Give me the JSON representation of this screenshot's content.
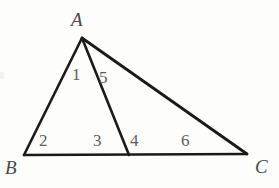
{
  "figure": {
    "type": "geometry-diagram",
    "background_color": "#fdfdfc",
    "stroke_color": "#1a1a1a",
    "label_color": "#4a4a4a",
    "angle_label_color": "#5d5d5d",
    "stroke_width": 2.6
  },
  "points": {
    "A": {
      "x": 82,
      "y": 38
    },
    "B": {
      "x": 24,
      "y": 155
    },
    "C": {
      "x": 247,
      "y": 154
    },
    "D": {
      "x": 129,
      "y": 155
    }
  },
  "segments": [
    {
      "name": "AB",
      "from": "A",
      "to": "B"
    },
    {
      "name": "AD",
      "from": "A",
      "to": "D"
    },
    {
      "name": "AC",
      "from": "A",
      "to": "C"
    },
    {
      "name": "BC",
      "from": "B",
      "to": "C"
    }
  ],
  "vertex_labels": [
    {
      "id": "A",
      "text": "A",
      "x": 71,
      "y": 10
    },
    {
      "id": "B",
      "text": "B",
      "x": 5,
      "y": 158
    },
    {
      "id": "C",
      "text": "C",
      "x": 255,
      "y": 157
    }
  ],
  "angle_labels": [
    {
      "id": "1",
      "text": "1",
      "x": 72,
      "y": 66,
      "at_vertex": "A",
      "between": "AB and AD"
    },
    {
      "id": "5",
      "text": "5",
      "x": 99,
      "y": 69,
      "at_vertex": "A",
      "between": "AD and AC"
    },
    {
      "id": "2",
      "text": "2",
      "x": 39,
      "y": 132,
      "at_vertex": "B",
      "between": "BA and BC"
    },
    {
      "id": "3",
      "text": "3",
      "x": 93,
      "y": 132,
      "at_vertex": "D",
      "between": "DB and DA"
    },
    {
      "id": "4",
      "text": "4",
      "x": 130,
      "y": 132,
      "at_vertex": "D",
      "between": "DA and DC"
    },
    {
      "id": "6",
      "text": "6",
      "x": 181,
      "y": 132,
      "at_vertex": "C",
      "between": "CA and CB"
    }
  ]
}
